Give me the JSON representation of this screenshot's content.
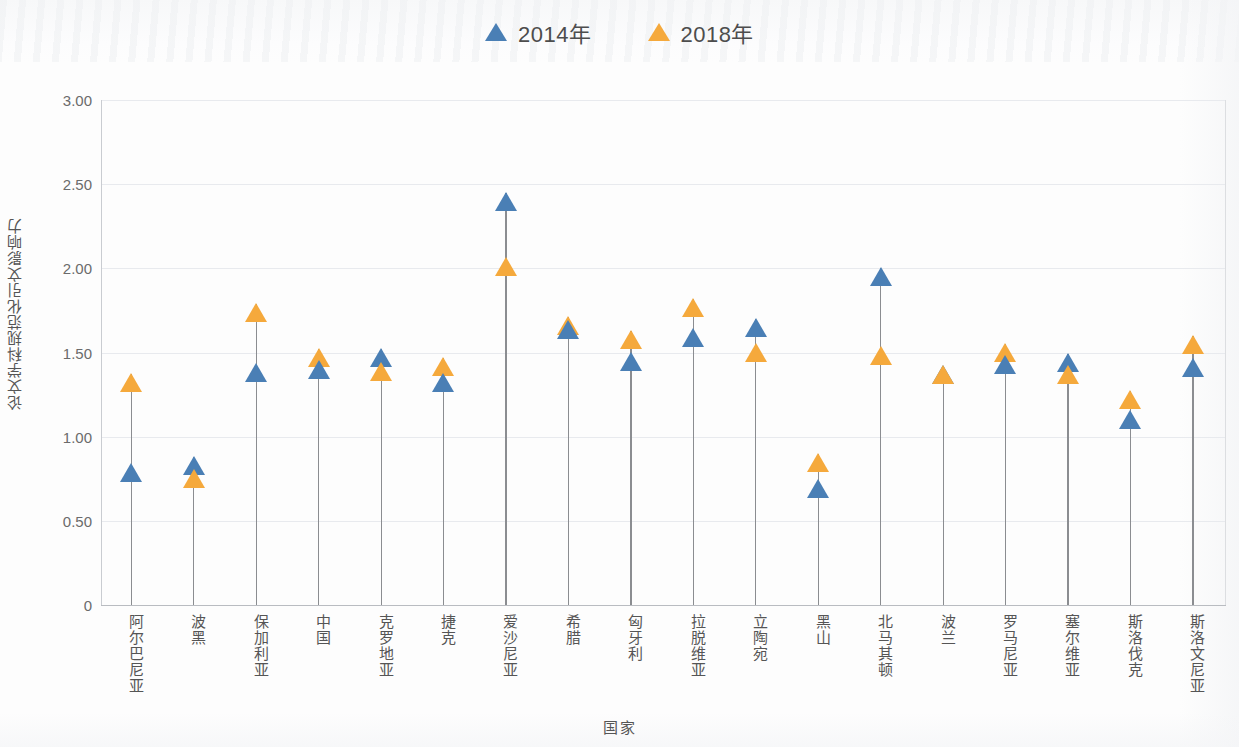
{
  "legend": {
    "items": [
      {
        "label": "2014年",
        "color": "#4a7fb5",
        "marker": "triangle-up-icon"
      },
      {
        "label": "2018年",
        "color": "#f5a93c",
        "marker": "triangle-up-icon"
      }
    ]
  },
  "axes": {
    "y_title": "论文学科规范化引文影响力",
    "x_title": "国家",
    "y_ticks": [
      "3.00",
      "2.50",
      "2.00",
      "1.50",
      "1.00",
      "0.50",
      "0"
    ]
  },
  "chart_data": {
    "type": "scatter",
    "title": "",
    "xlabel": "国家",
    "ylabel": "论文学科规范化引文影响力",
    "ylim": [
      0,
      3.0
    ],
    "ytick_values": [
      3.0,
      2.5,
      2.0,
      1.5,
      1.0,
      0.5,
      0
    ],
    "grid": true,
    "legend_position": "top-center",
    "categories": [
      "阿尔巴尼亚",
      "波黑",
      "保加利亚",
      "中国",
      "克罗地亚",
      "捷克",
      "爱沙尼亚",
      "希腊",
      "匈牙利",
      "拉脱维亚",
      "立陶宛",
      "黑山",
      "北马其顿",
      "波兰",
      "罗马尼亚",
      "塞尔维亚",
      "斯洛伐克",
      "斯洛文尼亚"
    ],
    "series": [
      {
        "name": "2014年",
        "color": "#4a7fb5",
        "values": [
          0.84,
          0.88,
          1.43,
          1.45,
          1.52,
          1.37,
          2.45,
          1.69,
          1.5,
          1.64,
          1.7,
          0.74,
          2.0,
          1.42,
          1.48,
          1.49,
          1.15,
          1.46
        ]
      },
      {
        "name": "2018年",
        "color": "#f5a93c",
        "values": [
          1.37,
          0.8,
          1.79,
          1.52,
          1.44,
          1.47,
          2.06,
          1.71,
          1.63,
          1.82,
          1.55,
          0.9,
          1.53,
          1.42,
          1.55,
          1.42,
          1.27,
          1.6
        ]
      }
    ]
  }
}
